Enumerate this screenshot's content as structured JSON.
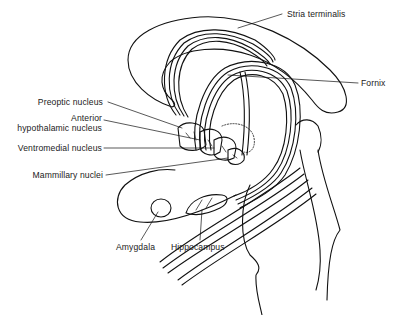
{
  "figure": {
    "type": "anatomical line drawing"
  },
  "labels": {
    "stria_terminalis": "Stria terminalis",
    "fornix": "Fornix",
    "preoptic_nucleus": "Preoptic nucleus",
    "anterior_line1": "Anterior",
    "anterior_line2": "hypothalamic nucleus",
    "ventromedial_nucleus": "Ventromedial nucleus",
    "mammillary_nuclei": "Mammillary nuclei",
    "amygdala": "Amygdala",
    "hippocampus": "Hippocampus"
  }
}
